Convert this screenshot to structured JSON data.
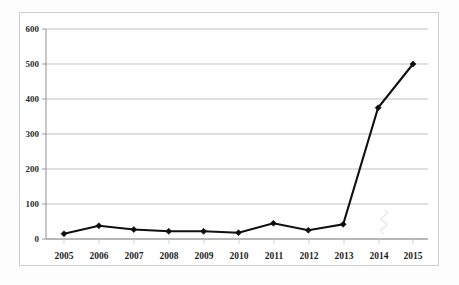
{
  "chart_data": {
    "type": "line",
    "title": "",
    "subtitle": "",
    "xlabel": "",
    "ylabel": "",
    "categories": [
      "2005",
      "2006",
      "2007",
      "2008",
      "2009",
      "2010",
      "2011",
      "2012",
      "2013",
      "2014",
      "2015"
    ],
    "values": [
      15,
      38,
      27,
      22,
      22,
      18,
      45,
      25,
      42,
      375,
      500
    ],
    "series": [
      {
        "name": "",
        "values": [
          15,
          38,
          27,
          22,
          22,
          18,
          45,
          25,
          42,
          375,
          500
        ]
      }
    ],
    "ylim": [
      0,
      600
    ],
    "yticks": [
      0,
      100,
      200,
      300,
      400,
      500,
      600
    ],
    "ytick_labels": [
      "0",
      "100",
      "200",
      "300",
      "400",
      "500",
      "600"
    ],
    "xtick_labels": [
      "2005",
      "2006",
      "2007",
      "2008",
      "2009",
      "2010",
      "2011",
      "2012",
      "2013",
      "2014",
      "2015"
    ],
    "grid": true,
    "grid_axis": "y",
    "legend": false,
    "legend_position": "none",
    "marker": "diamond",
    "line_color": "#111111",
    "marker_color": "#0d0d0d",
    "grid_color": "#b9b9b9",
    "axis_color": "#8f8f8f",
    "background_color": "#ffffff",
    "frame_color": "#cfcfcf",
    "annotations": []
  }
}
